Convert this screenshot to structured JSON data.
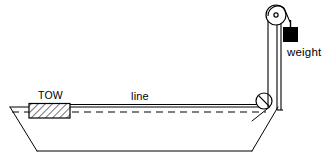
{
  "figure": {
    "background_color": "#ffffff",
    "stroke_color": "#000000",
    "fill_color": "#000000",
    "labels": {
      "tow": "TOW",
      "line": "line",
      "weight": "weight"
    },
    "parts": {
      "hull_name": "boat-hull",
      "tow_block_name": "tow-block",
      "rope_name": "tow-line",
      "waterline_name": "waterline-dashed",
      "lower_pulley_name": "lower-pulley",
      "mast_name": "mast-post",
      "upper_pulley_name": "upper-pulley",
      "weight_block_name": "weight-block"
    }
  },
  "geometry": {
    "canvas": {
      "width": 324,
      "height": 159
    },
    "hull": {
      "top_left": [
        10,
        107
      ],
      "top_right": [
        278,
        107
      ],
      "bottom_left": [
        37,
        151
      ],
      "bottom_right": [
        252,
        151
      ]
    },
    "tow_block": {
      "x": 29,
      "y": 104,
      "width": 41,
      "height": 14
    },
    "rope_line": {
      "x1": 70,
      "y1": 105,
      "x2": 262,
      "y2": 105
    },
    "dashed_line": {
      "x1": 10,
      "y1": 112,
      "x2": 268,
      "y2": 112
    },
    "lower_pulley": {
      "cx": 264,
      "cy": 101,
      "r": 8
    },
    "mast": {
      "x1": 268,
      "x2": 277,
      "y_top": 16,
      "y_bottom": 110
    },
    "upper_pulley": {
      "cx": 276,
      "cy": 15,
      "r": 10
    },
    "weight_block": {
      "x": 284,
      "y": 27,
      "width": 14,
      "height": 14
    },
    "weight_rope": {
      "x": 291,
      "y1": 15,
      "y2": 27
    }
  }
}
